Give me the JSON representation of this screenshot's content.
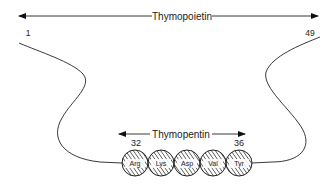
{
  "diagram": {
    "title_arrow": {
      "label": "Thymopoietin"
    },
    "residue_start": "1",
    "residue_end": "49",
    "sub_arrow": {
      "label": "Thymopentin",
      "start": "32",
      "end": "36"
    },
    "residues": [
      {
        "name": "Arg"
      },
      {
        "name": "Lys"
      },
      {
        "name": "Asp"
      },
      {
        "name": "Val"
      },
      {
        "name": "Tyr"
      }
    ],
    "colors": {
      "line": "#222222",
      "hatch": "#333333",
      "background": "#ffffff"
    }
  }
}
